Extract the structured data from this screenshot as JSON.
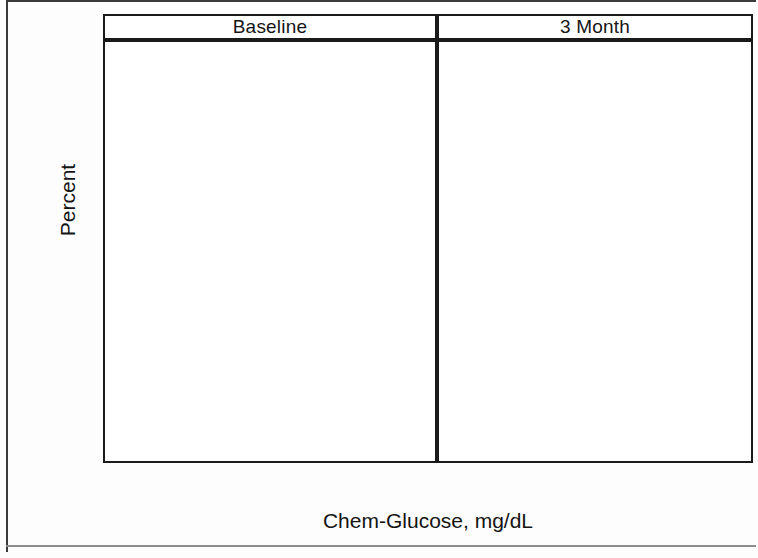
{
  "chart_data": {
    "type": "bar",
    "title": "",
    "xlabel": "Chem-Glucose, mg/dL",
    "ylabel": "Percent",
    "ylim": [
      0,
      26
    ],
    "xlim": [
      93.5,
      121.5
    ],
    "yticks": [
      0,
      5,
      10,
      15,
      20,
      25
    ],
    "ytick_labels": [
      "0",
      "5",
      "10",
      "15",
      "20",
      "25"
    ],
    "xticks": [
      95,
      100,
      105,
      110,
      115,
      120
    ],
    "xtick_labels": [
      "95",
      "100",
      "105",
      "110",
      "115",
      "120"
    ],
    "grid": false,
    "legend": "none",
    "bin_width": 3,
    "panels": [
      {
        "label": "Baseline",
        "bin_centers": [
          95.5,
          98.5,
          101.5,
          104.5,
          107.5,
          110.5,
          113.5,
          116.5
        ],
        "bin_edges": [
          94,
          97,
          100,
          103,
          106,
          109,
          112,
          115,
          118
        ],
        "values": [
          1.3,
          11.7,
          24.7,
          23.4,
          15.6,
          14.3,
          6.5,
          2.6
        ]
      },
      {
        "label": "3 Month",
        "bin_centers": [
          95.5,
          98.5,
          101.5,
          104.5,
          107.5,
          110.5,
          113.5,
          116.5
        ],
        "bin_edges": [
          94,
          97,
          100,
          103,
          106,
          109,
          112,
          115,
          118
        ],
        "values": [
          5.3,
          10.7,
          21.3,
          21.3,
          18.7,
          17.4,
          3.9,
          1.3
        ]
      }
    ],
    "colors": {
      "bar_fill": "#ccdeeb",
      "bar_outline": "#242424",
      "axis": "#1a1a1a",
      "text": "#141414",
      "background": "#ffffff"
    }
  },
  "axes": {
    "y_title": "Percent",
    "x_title": "Chem-Glucose, mg/dL"
  },
  "panel_headers": {
    "left": "Baseline",
    "right": "3 Month"
  }
}
